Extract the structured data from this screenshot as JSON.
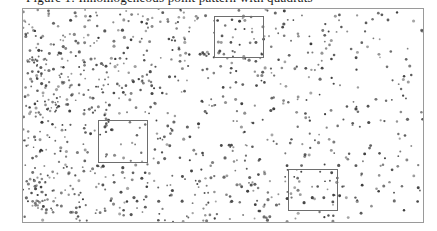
{
  "caption": {
    "text": "Figure 1: Inhomogeneous point pattern with quadrats"
  },
  "figure": {
    "name": "point-pattern-plot",
    "background_color": "#ffffff",
    "frame_color": "#9a9a9a",
    "point_color": "#3c3c3c",
    "quadrat_color": "#6e6e6e",
    "width": 437,
    "height": 231
  },
  "chart_data": {
    "type": "scatter",
    "title": "",
    "subtitle": "",
    "xlabel": "",
    "ylabel": "",
    "xlim": [
      0,
      402
    ],
    "ylim": [
      0,
      215
    ],
    "grid": false,
    "legend": null,
    "axis_ticks": {
      "x": [],
      "y": []
    },
    "marker": {
      "shape": "point",
      "size": 1.3,
      "color": "#3c3c3c"
    },
    "n_points": 980,
    "intensity_model": {
      "type": "horizontal-gradient",
      "left_relative_intensity": 1.0,
      "right_relative_intensity": 0.3,
      "seed": 20240917
    },
    "annotations": [
      {
        "name": "quadrat-top",
        "label": "",
        "shape": "rectangle",
        "x": 191,
        "y": 7,
        "width": 50,
        "height": 42
      },
      {
        "name": "quadrat-middle-left",
        "label": "",
        "shape": "rectangle",
        "x": 75,
        "y": 111,
        "width": 50,
        "height": 43
      },
      {
        "name": "quadrat-bottom-right",
        "label": "",
        "shape": "rectangle",
        "x": 265,
        "y": 160,
        "width": 50,
        "height": 42
      }
    ]
  }
}
